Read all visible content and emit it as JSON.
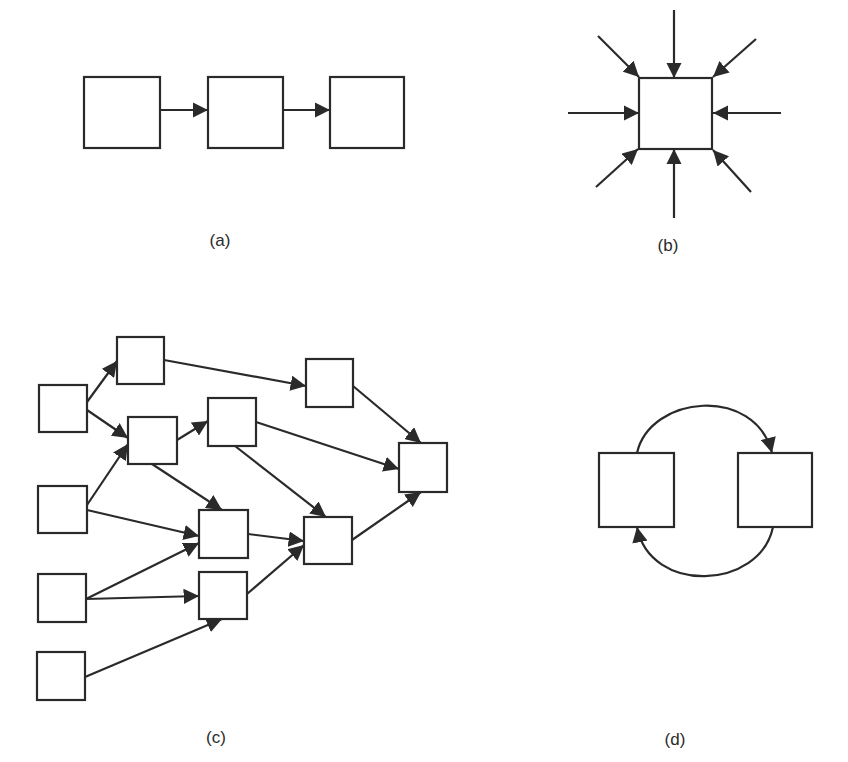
{
  "figure": {
    "colors": {
      "stroke": "#2a2a2a",
      "background": "#ffffff"
    },
    "panels": [
      {
        "id": "a",
        "label": "(a)",
        "label_pos": [
          220,
          246
        ],
        "description": "linear chain",
        "boxes": [
          {
            "id": "a1",
            "x": 84,
            "y": 77,
            "w": 76,
            "h": 71
          },
          {
            "id": "a2",
            "x": 208,
            "y": 77,
            "w": 75,
            "h": 71
          },
          {
            "id": "a3",
            "x": 330,
            "y": 77,
            "w": 74,
            "h": 71
          }
        ],
        "edges": [
          {
            "from": [
              160,
              110
            ],
            "to": [
              208,
              110
            ]
          },
          {
            "from": [
              283,
              110
            ],
            "to": [
              330,
              110
            ]
          }
        ]
      },
      {
        "id": "b",
        "label": "(b)",
        "label_pos": [
          668,
          251
        ],
        "description": "many inputs converge on one node",
        "boxes": [
          {
            "id": "b1",
            "x": 639,
            "y": 78,
            "w": 73,
            "h": 71
          }
        ],
        "edges": [
          {
            "from": [
              674,
              10
            ],
            "to": [
              674,
              78
            ]
          },
          {
            "from": [
              598,
              36
            ],
            "to": [
              639,
              77
            ]
          },
          {
            "from": [
              756,
              39
            ],
            "to": [
              713,
              77
            ]
          },
          {
            "from": [
              568,
              113
            ],
            "to": [
              639,
              113
            ]
          },
          {
            "from": [
              781,
              113
            ],
            "to": [
              713,
              113
            ]
          },
          {
            "from": [
              596,
              187
            ],
            "to": [
              638,
              149
            ]
          },
          {
            "from": [
              674,
              218
            ],
            "to": [
              674,
              149
            ]
          },
          {
            "from": [
              751,
              192
            ],
            "to": [
              713,
              150
            ]
          }
        ]
      },
      {
        "id": "c",
        "label": "(c)",
        "label_pos": [
          216,
          743
        ],
        "description": "network of nodes",
        "boxes": [
          {
            "id": "A",
            "x": 39,
            "y": 385,
            "w": 48,
            "h": 47
          },
          {
            "id": "B",
            "x": 117,
            "y": 337,
            "w": 47,
            "h": 47
          },
          {
            "id": "C",
            "x": 128,
            "y": 417,
            "w": 49,
            "h": 47
          },
          {
            "id": "D",
            "x": 208,
            "y": 398,
            "w": 48,
            "h": 48
          },
          {
            "id": "E",
            "x": 306,
            "y": 359,
            "w": 47,
            "h": 48
          },
          {
            "id": "F",
            "x": 399,
            "y": 443,
            "w": 48,
            "h": 49
          },
          {
            "id": "G",
            "x": 38,
            "y": 486,
            "w": 49,
            "h": 47
          },
          {
            "id": "H",
            "x": 199,
            "y": 510,
            "w": 49,
            "h": 48
          },
          {
            "id": "I",
            "x": 304,
            "y": 517,
            "w": 48,
            "h": 47
          },
          {
            "id": "J",
            "x": 38,
            "y": 574,
            "w": 48,
            "h": 48
          },
          {
            "id": "K",
            "x": 199,
            "y": 572,
            "w": 48,
            "h": 47
          },
          {
            "id": "L",
            "x": 37,
            "y": 652,
            "w": 48,
            "h": 48
          }
        ],
        "edges": [
          {
            "from": [
              87,
              402
            ],
            "to": [
              117,
              361
            ]
          },
          {
            "from": [
              87,
              410
            ],
            "to": [
              128,
              438
            ]
          },
          {
            "from": [
              164,
              360
            ],
            "to": [
              306,
              386
            ]
          },
          {
            "from": [
              177,
              440
            ],
            "to": [
              208,
              421
            ]
          },
          {
            "from": [
              152,
              464
            ],
            "to": [
              222,
              510
            ]
          },
          {
            "from": [
              87,
              505
            ],
            "to": [
              128,
              444
            ]
          },
          {
            "from": [
              87,
              510
            ],
            "to": [
              199,
              536
            ]
          },
          {
            "from": [
              86,
              599
            ],
            "to": [
              199,
              543
            ]
          },
          {
            "from": [
              86,
              599
            ],
            "to": [
              199,
              596
            ]
          },
          {
            "from": [
              85,
              677
            ],
            "to": [
              222,
              619
            ]
          },
          {
            "from": [
              256,
              422
            ],
            "to": [
              399,
              469
            ]
          },
          {
            "from": [
              235,
              446
            ],
            "to": [
              326,
              517
            ]
          },
          {
            "from": [
              353,
              386
            ],
            "to": [
              421,
              443
            ]
          },
          {
            "from": [
              248,
              534
            ],
            "to": [
              304,
              541
            ]
          },
          {
            "from": [
              247,
              594
            ],
            "to": [
              304,
              545
            ]
          },
          {
            "from": [
              352,
              540
            ],
            "to": [
              421,
              492
            ]
          }
        ]
      },
      {
        "id": "d",
        "label": "(d)",
        "label_pos": [
          675,
          745
        ],
        "description": "two nodes in a feedback loop",
        "boxes": [
          {
            "id": "d1",
            "x": 599,
            "y": 453,
            "w": 75,
            "h": 74
          },
          {
            "id": "d2",
            "x": 738,
            "y": 453,
            "w": 74,
            "h": 74
          }
        ],
        "arcs": [
          {
            "path": "M 637 453 C 650 395, 755 385, 772 453",
            "arrow_at": [
              772,
              453
            ],
            "direction": "down"
          },
          {
            "path": "M 773 527 C 760 590, 650 595, 637 527",
            "arrow_at": [
              637,
              527
            ],
            "direction": "up"
          }
        ]
      }
    ]
  }
}
